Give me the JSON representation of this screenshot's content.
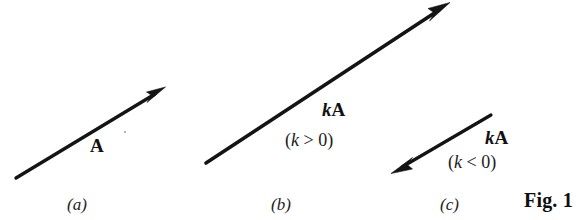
{
  "figure": {
    "caption": "Fig. 1",
    "background_color": "#ffffff",
    "ink_color": "#141414",
    "width": 585,
    "height": 220
  },
  "panels": [
    {
      "id": "a",
      "letter": "(a)",
      "vector_label": "A",
      "vector_label_parts": {
        "scalar": "",
        "vector": "A"
      },
      "condition": "",
      "arrow": {
        "x1": 16,
        "y1": 178,
        "x2": 163,
        "y2": 89,
        "direction": "up-right",
        "head_at": "end"
      }
    },
    {
      "id": "b",
      "letter": "(b)",
      "vector_label": "kA",
      "vector_label_parts": {
        "scalar": "k",
        "vector": "A"
      },
      "condition": "(k > 0)",
      "condition_parts": {
        "open": "(",
        "scalar": "k",
        "relation": " > 0",
        "close": ")"
      },
      "arrow": {
        "x1": 206,
        "y1": 163,
        "x2": 448,
        "y2": 4,
        "direction": "up-right",
        "head_at": "end"
      }
    },
    {
      "id": "c",
      "letter": "(c)",
      "vector_label": "kA",
      "vector_label_parts": {
        "scalar": "k",
        "vector": "A"
      },
      "condition": "(k < 0)",
      "condition_parts": {
        "open": "(",
        "scalar": "k",
        "relation": " < 0",
        "close": ")"
      },
      "arrow": {
        "x1": 491,
        "y1": 115,
        "x2": 392,
        "y2": 173,
        "direction": "down-left",
        "head_at": "end"
      }
    }
  ]
}
